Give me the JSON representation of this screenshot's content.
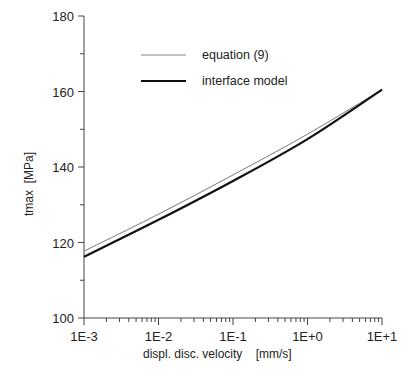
{
  "chart_data": {
    "type": "line",
    "title": "",
    "xlabel": "displ. disc. velocity    [mm/s]",
    "ylabel": "tmax  [MPa]",
    "xscale": "log",
    "xlim": [
      0.001,
      10
    ],
    "ylim": [
      100,
      180
    ],
    "x_tick_labels": [
      "1E-3",
      "1E-2",
      "1E-1",
      "1E+0",
      "1E+1"
    ],
    "y_tick_labels": [
      "100",
      "120",
      "140",
      "160",
      "180"
    ],
    "grid": false,
    "legend_position": "upper-center",
    "x": [
      0.001,
      0.01,
      0.1,
      1,
      10
    ],
    "series": [
      {
        "name": "equation (9)",
        "style": "thin",
        "color": "#777777",
        "values": [
          117.7,
          127.5,
          137.9,
          148.7,
          160.5
        ]
      },
      {
        "name": "interface model",
        "style": "thick",
        "color": "#111111",
        "values": [
          116.2,
          126.0,
          136.3,
          147.4,
          160.5
        ]
      }
    ]
  }
}
